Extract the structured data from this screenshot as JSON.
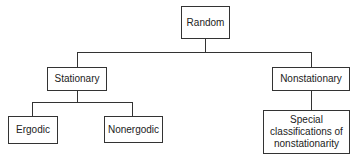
{
  "diagram": {
    "type": "tree",
    "nodes": {
      "root": {
        "label": "Random"
      },
      "stationary": {
        "label": "Stationary"
      },
      "nonstationary": {
        "label": "Nonstationary"
      },
      "ergodic": {
        "label": "Ergodic"
      },
      "nonergodic": {
        "label": "Nonergodic"
      },
      "special": {
        "label": "Special classifications of nonstationarity"
      }
    },
    "edges": [
      [
        "root",
        "stationary"
      ],
      [
        "root",
        "nonstationary"
      ],
      [
        "stationary",
        "ergodic"
      ],
      [
        "stationary",
        "nonergodic"
      ],
      [
        "nonstationary",
        "special"
      ]
    ],
    "colors": {
      "line": "#333333",
      "background": "#ffffff",
      "text": "#222222"
    }
  }
}
